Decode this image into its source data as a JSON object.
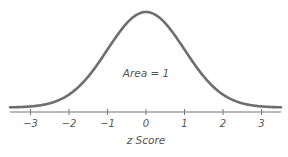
{
  "chart_data": {
    "type": "line",
    "title": "",
    "xlabel": "z Score",
    "ylabel": "",
    "x_ticks": [
      -3,
      -2,
      -1,
      0,
      1,
      2,
      3
    ],
    "tick_labels": [
      "−3",
      "−2",
      "−1",
      "0",
      "1",
      "2",
      "3"
    ],
    "xlim": [
      -3.5,
      3.5
    ],
    "grid": false,
    "legend": null,
    "annotations": [
      {
        "text": "Area = 1",
        "x": 0,
        "y": 0.2
      }
    ],
    "series": [
      {
        "name": "Standard normal distribution",
        "function": "exp(-z^2/2)/sqrt(2*pi)",
        "x": [
          -3.5,
          -3,
          -2.5,
          -2,
          -1.5,
          -1,
          -0.5,
          0,
          0.5,
          1,
          1.5,
          2,
          2.5,
          3,
          3.5
        ],
        "values": [
          0.0009,
          0.0044,
          0.0175,
          0.054,
          0.1295,
          0.242,
          0.3521,
          0.3989,
          0.3521,
          0.242,
          0.1295,
          0.054,
          0.0175,
          0.0044,
          0.0009
        ]
      }
    ],
    "colors": {
      "curve": "#6e6e6e",
      "axis": "#777777",
      "text": "#555555"
    }
  },
  "labels": {
    "xlabel": "z Score",
    "annotation": "Area = 1",
    "ticks": [
      "−3",
      "−2",
      "−1",
      "0",
      "1",
      "2",
      "3"
    ]
  }
}
